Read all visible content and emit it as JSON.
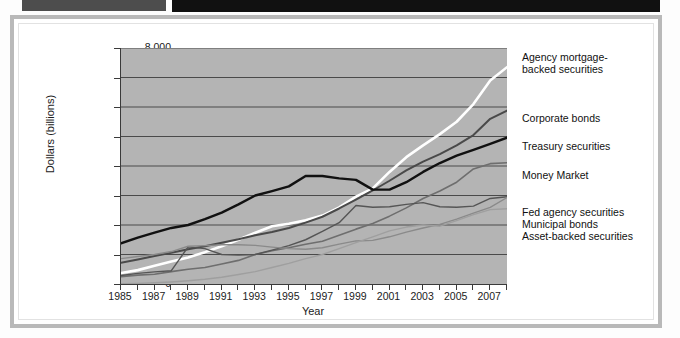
{
  "decor": {
    "strip_gray_color": "#4d4d4d",
    "strip_black_color": "#111111"
  },
  "chart_data": {
    "type": "line",
    "title": "",
    "xlabel": "Year",
    "ylabel": "Dollars (billions)",
    "xlim": [
      1985,
      2008
    ],
    "ylim": [
      0,
      8000
    ],
    "grid": true,
    "legend_position": "right-callout",
    "plot_background": "#b4b4b4",
    "xticks": [
      "1985",
      "1987",
      "1989",
      "1991",
      "1993",
      "1995",
      "1997",
      "1999",
      "2001",
      "2003",
      "2005",
      "2007"
    ],
    "yticks": [
      "0",
      "1,000",
      "2,000",
      "3,000",
      "4,000",
      "5,000",
      "6,000",
      "7,000",
      "8,000"
    ],
    "x": [
      1985,
      1986,
      1987,
      1988,
      1989,
      1990,
      1991,
      1992,
      1993,
      1994,
      1995,
      1996,
      1997,
      1998,
      1999,
      2000,
      2001,
      2002,
      2003,
      2004,
      2005,
      2006,
      2007,
      2008
    ],
    "series": [
      {
        "name": "Agency mortgage-backed securities",
        "color": "#ffffff",
        "width": 2.6,
        "values": [
          370,
          470,
          620,
          760,
          900,
          1080,
          1280,
          1500,
          1740,
          1960,
          2040,
          2160,
          2320,
          2600,
          2960,
          3240,
          3800,
          4300,
          4700,
          5080,
          5500,
          6100,
          6900,
          7350
        ]
      },
      {
        "name": "Corporate bonds",
        "color": "#4a4a4a",
        "width": 2.0,
        "values": [
          720,
          830,
          950,
          1060,
          1180,
          1280,
          1400,
          1520,
          1650,
          1760,
          1900,
          2080,
          2280,
          2560,
          2860,
          3170,
          3500,
          3850,
          4150,
          4400,
          4700,
          5050,
          5600,
          5880
        ]
      },
      {
        "name": "Treasury securities",
        "color": "#111111",
        "width": 2.4,
        "values": [
          1380,
          1570,
          1740,
          1900,
          2000,
          2200,
          2420,
          2700,
          3000,
          3150,
          3310,
          3660,
          3660,
          3580,
          3530,
          3200,
          3200,
          3450,
          3800,
          4100,
          4350,
          4550,
          4750,
          4960
        ]
      },
      {
        "name": "Money Market",
        "color": "#6e6e6e",
        "width": 1.6,
        "values": [
          250,
          300,
          330,
          420,
          500,
          560,
          680,
          800,
          1000,
          1130,
          1230,
          1350,
          1450,
          1650,
          1860,
          2050,
          2300,
          2580,
          2900,
          3150,
          3450,
          3900,
          4080,
          4110
        ]
      },
      {
        "name": "Fed agency securities",
        "color": "#555555",
        "width": 1.4,
        "values": [
          290,
          360,
          410,
          450,
          1260,
          1200,
          1000,
          980,
          1000,
          1150,
          1300,
          1500,
          1780,
          2080,
          2660,
          2600,
          2620,
          2700,
          2760,
          2620,
          2600,
          2640,
          2900,
          2960
        ]
      },
      {
        "name": "Municipal bonds",
        "color": "#8a8a8a",
        "width": 1.4,
        "values": [
          860,
          930,
          1000,
          1100,
          1280,
          1300,
          1330,
          1330,
          1310,
          1250,
          1200,
          1180,
          1230,
          1350,
          1460,
          1480,
          1600,
          1760,
          1900,
          2020,
          2200,
          2400,
          2600,
          2930
        ]
      },
      {
        "name": "Asset-backed securities",
        "color": "#9f9f9f",
        "width": 1.4,
        "values": [
          10,
          20,
          40,
          70,
          110,
          160,
          230,
          320,
          420,
          560,
          700,
          860,
          1000,
          1200,
          1400,
          1600,
          1800,
          1930,
          2000,
          1960,
          2150,
          2350,
          2520,
          2550
        ]
      }
    ]
  },
  "legend_callouts": [
    {
      "label": "Agency mortgage-\nbacked securities",
      "top": 3
    },
    {
      "label": "Corporate bonds",
      "top": 64
    },
    {
      "label": "Treasury securities",
      "top": 92
    },
    {
      "label": "Money Market",
      "top": 121
    },
    {
      "label": "Fed agency securities",
      "top": 158
    },
    {
      "label": "Municipal bonds",
      "top": 170
    },
    {
      "label": "Asset-backed securities",
      "top": 182
    }
  ]
}
